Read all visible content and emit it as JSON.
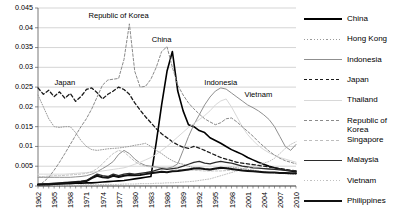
{
  "chart_data": {
    "type": "line",
    "title": "",
    "xlabel": "",
    "ylabel": "",
    "xlim": [
      1962,
      2010
    ],
    "ylim": [
      0,
      0.045
    ],
    "grid": true,
    "legend_position": "right",
    "ytick_labels": [
      "0",
      "0.005",
      "0.01",
      "0.015",
      "0.02",
      "0.025",
      "0.03",
      "0.035",
      "0.04",
      "0.045"
    ],
    "ytick_values": [
      0,
      0.005,
      0.01,
      0.015,
      0.02,
      0.025,
      0.03,
      0.035,
      0.04,
      0.045
    ],
    "xtick_labels": [
      "1962",
      "1965",
      "1968",
      "1971",
      "1974",
      "1977",
      "1980",
      "1983",
      "1986",
      "1989",
      "1992",
      "1995",
      "1998",
      "2001",
      "2004",
      "2007",
      "2010"
    ],
    "xtick_values": [
      1962,
      1965,
      1968,
      1971,
      1974,
      1977,
      1980,
      1983,
      1986,
      1989,
      1992,
      1995,
      1998,
      2001,
      2004,
      2007,
      2010
    ],
    "x": [
      1962,
      1963,
      1964,
      1965,
      1966,
      1967,
      1968,
      1969,
      1970,
      1971,
      1972,
      1973,
      1974,
      1975,
      1976,
      1977,
      1978,
      1979,
      1980,
      1981,
      1982,
      1983,
      1984,
      1985,
      1986,
      1987,
      1988,
      1989,
      1990,
      1991,
      1992,
      1993,
      1994,
      1995,
      1996,
      1997,
      1998,
      1999,
      2000,
      2001,
      2002,
      2003,
      2004,
      2005,
      2006,
      2007,
      2008,
      2009,
      2010
    ],
    "annotations": [
      {
        "text": "Japan",
        "x": 1967,
        "y": 0.0255
      },
      {
        "text": "Republic of Korea",
        "x": 1977,
        "y": 0.0425
      },
      {
        "text": "China",
        "x": 1985,
        "y": 0.0365
      },
      {
        "text": "Indonesia",
        "x": 1996,
        "y": 0.0255
      },
      {
        "text": "Vietnam",
        "x": 2003,
        "y": 0.0225
      }
    ],
    "series": [
      {
        "name": "China",
        "color": "#000000",
        "style": "solid",
        "width": 1.6,
        "values": [
          0.0004,
          0.0004,
          0.0005,
          0.0005,
          0.0006,
          0.0006,
          0.0006,
          0.0007,
          0.0007,
          0.0008,
          0.0008,
          0.0009,
          0.001,
          0.0011,
          0.0012,
          0.0013,
          0.0014,
          0.0016,
          0.0018,
          0.002,
          0.0022,
          0.0024,
          0.011,
          0.0205,
          0.029,
          0.034,
          0.024,
          0.019,
          0.0155,
          0.015,
          0.014,
          0.0135,
          0.0122,
          0.0115,
          0.0108,
          0.01,
          0.0092,
          0.0086,
          0.008,
          0.0072,
          0.0066,
          0.006,
          0.0055,
          0.005,
          0.0046,
          0.0043,
          0.004,
          0.0038,
          0.0036
        ]
      },
      {
        "name": "Hong Kong",
        "color": "#9a9a9a",
        "style": "dotted",
        "width": 1.0,
        "values": [
          0.023,
          0.02,
          0.017,
          0.015,
          0.0148,
          0.015,
          0.015,
          0.0135,
          0.0115,
          0.01,
          0.0092,
          0.009,
          0.0092,
          0.0094,
          0.0095,
          0.0096,
          0.0098,
          0.01,
          0.0103,
          0.0105,
          0.0108,
          0.01,
          0.009,
          0.0082,
          0.0072,
          0.0064,
          0.0058,
          0.0055,
          0.005,
          0.0046,
          0.0044,
          0.0042,
          0.004,
          0.0042,
          0.0044,
          0.0046,
          0.0048,
          0.0046,
          0.0044,
          0.0042,
          0.004,
          0.0038,
          0.0036,
          0.0034,
          0.0033,
          0.0032,
          0.0031,
          0.003,
          0.0029
        ]
      },
      {
        "name": "Indonesia",
        "color": "#8f8f8f",
        "style": "solid",
        "width": 1.0,
        "values": [
          0.0022,
          0.0022,
          0.0022,
          0.0022,
          0.0022,
          0.0022,
          0.0022,
          0.0023,
          0.0024,
          0.0026,
          0.003,
          0.0036,
          0.0044,
          0.0052,
          0.0062,
          0.008,
          0.009,
          0.0082,
          0.0068,
          0.0058,
          0.0052,
          0.005,
          0.0048,
          0.0046,
          0.0045,
          0.0048,
          0.0056,
          0.009,
          0.0125,
          0.0155,
          0.018,
          0.0205,
          0.0225,
          0.024,
          0.0248,
          0.0245,
          0.0235,
          0.0225,
          0.0215,
          0.0205,
          0.0198,
          0.019,
          0.018,
          0.0168,
          0.015,
          0.0125,
          0.01,
          0.009,
          0.0105
        ]
      },
      {
        "name": "Japan",
        "color": "#1a1a1a",
        "style": "dashed",
        "width": 1.3,
        "values": [
          0.0248,
          0.0232,
          0.0242,
          0.0226,
          0.0238,
          0.0222,
          0.0234,
          0.0214,
          0.0226,
          0.0244,
          0.0248,
          0.0236,
          0.022,
          0.0232,
          0.024,
          0.025,
          0.0244,
          0.0232,
          0.021,
          0.0192,
          0.0175,
          0.016,
          0.0145,
          0.0132,
          0.0122,
          0.0112,
          0.0104,
          0.0098,
          0.0095,
          0.01,
          0.0096,
          0.009,
          0.0084,
          0.0078,
          0.0072,
          0.0068,
          0.0064,
          0.006,
          0.0058,
          0.0056,
          0.0054,
          0.0052,
          0.005,
          0.0048,
          0.0046,
          0.0044,
          0.0042,
          0.004,
          0.0038
        ]
      },
      {
        "name": "Thailand",
        "color": "#d8d8d8",
        "style": "solid",
        "width": 1.0,
        "values": [
          0.003,
          0.003,
          0.003,
          0.003,
          0.003,
          0.003,
          0.0031,
          0.0032,
          0.0033,
          0.0034,
          0.0035,
          0.0036,
          0.0038,
          0.004,
          0.0042,
          0.0044,
          0.0046,
          0.005,
          0.0055,
          0.006,
          0.0066,
          0.0072,
          0.008,
          0.009,
          0.01,
          0.0112,
          0.0124,
          0.0136,
          0.0148,
          0.0158,
          0.0168,
          0.0178,
          0.019,
          0.0205,
          0.0215,
          0.022,
          0.02,
          0.0175,
          0.015,
          0.013,
          0.0115,
          0.0102,
          0.0092,
          0.0084,
          0.0078,
          0.0072,
          0.0068,
          0.0064,
          0.006
        ]
      },
      {
        "name": "Republic of Korea",
        "color": "#8a8a8a",
        "style": "dashed",
        "width": 1.0,
        "values": [
          0.0,
          0.001,
          0.0022,
          0.004,
          0.006,
          0.0082,
          0.0105,
          0.0128,
          0.015,
          0.017,
          0.0195,
          0.0225,
          0.0255,
          0.0268,
          0.027,
          0.0272,
          0.032,
          0.041,
          0.029,
          0.025,
          0.0252,
          0.027,
          0.03,
          0.034,
          0.0352,
          0.03,
          0.0255,
          0.023,
          0.021,
          0.0195,
          0.0182,
          0.017,
          0.0162,
          0.0155,
          0.016,
          0.017,
          0.0172,
          0.0162,
          0.015,
          0.0138,
          0.0126,
          0.0112,
          0.01,
          0.0088,
          0.0078,
          0.007,
          0.0064,
          0.006,
          0.0056
        ]
      },
      {
        "name": "Singapore",
        "color": "#bdbdbd",
        "style": "dashed",
        "width": 0.9,
        "values": [
          0.0024,
          0.0024,
          0.0025,
          0.0026,
          0.0026,
          0.0027,
          0.0028,
          0.0029,
          0.003,
          0.0032,
          0.0036,
          0.0044,
          0.0056,
          0.007,
          0.0082,
          0.009,
          0.0086,
          0.0074,
          0.0062,
          0.0054,
          0.005,
          0.0048,
          0.0046,
          0.0045,
          0.0044,
          0.0043,
          0.0042,
          0.0041,
          0.004,
          0.004,
          0.0039,
          0.0038,
          0.0038,
          0.0038,
          0.0038,
          0.0039,
          0.004,
          0.004,
          0.004,
          0.0039,
          0.0038,
          0.0037,
          0.0036,
          0.0035,
          0.0034,
          0.0033,
          0.0032,
          0.0031,
          0.003
        ]
      },
      {
        "name": "Malaysia",
        "color": "#2b2b2b",
        "style": "solid",
        "width": 1.3,
        "values": [
          0.0004,
          0.0005,
          0.0006,
          0.0007,
          0.0008,
          0.0009,
          0.001,
          0.0011,
          0.0012,
          0.0014,
          0.0022,
          0.003,
          0.0026,
          0.0024,
          0.003,
          0.0026,
          0.003,
          0.0032,
          0.003,
          0.0032,
          0.0034,
          0.0036,
          0.004,
          0.0044,
          0.0042,
          0.0044,
          0.0046,
          0.005,
          0.0055,
          0.006,
          0.0062,
          0.0058,
          0.0056,
          0.006,
          0.0062,
          0.006,
          0.0058,
          0.0054,
          0.005,
          0.0048,
          0.0046,
          0.0045,
          0.0044,
          0.0043,
          0.0042,
          0.0041,
          0.004,
          0.0039,
          0.0038
        ]
      },
      {
        "name": "Vietnam",
        "color": "#c0c0c0",
        "style": "dotted",
        "width": 1.0,
        "values": [
          0.0002,
          0.0002,
          0.0002,
          0.0002,
          0.0002,
          0.0002,
          0.0002,
          0.0002,
          0.0003,
          0.0003,
          0.0003,
          0.0003,
          0.0004,
          0.0004,
          0.0004,
          0.0004,
          0.0005,
          0.0005,
          0.0005,
          0.0006,
          0.0006,
          0.0006,
          0.0007,
          0.0007,
          0.0008,
          0.0008,
          0.0009,
          0.001,
          0.0011,
          0.0012,
          0.0014,
          0.0016,
          0.0018,
          0.0022,
          0.0026,
          0.003,
          0.0034,
          0.0038,
          0.0042,
          0.0046,
          0.005,
          0.0054,
          0.0058,
          0.0062,
          0.007,
          0.0082,
          0.0095,
          0.0105,
          0.0112
        ]
      },
      {
        "name": "Philippines",
        "color": "#111111",
        "style": "solid",
        "width": 2.0,
        "values": [
          0.0003,
          0.0004,
          0.0004,
          0.0005,
          0.0006,
          0.0007,
          0.0008,
          0.0009,
          0.001,
          0.0012,
          0.002,
          0.0026,
          0.0022,
          0.0021,
          0.0026,
          0.0023,
          0.0026,
          0.0028,
          0.0027,
          0.0028,
          0.003,
          0.0032,
          0.0034,
          0.0036,
          0.0035,
          0.0037,
          0.0038,
          0.004,
          0.0042,
          0.0044,
          0.0045,
          0.0043,
          0.0042,
          0.0044,
          0.0046,
          0.0045,
          0.0043,
          0.0041,
          0.0039,
          0.0038,
          0.0037,
          0.0036,
          0.0035,
          0.0034,
          0.0034,
          0.0033,
          0.0033,
          0.0032,
          0.0032
        ]
      }
    ]
  },
  "legend": {
    "items": [
      {
        "label": "China",
        "color": "#000000",
        "style": "solid",
        "width": 1.6
      },
      {
        "label": "Hong Kong",
        "color": "#9a9a9a",
        "style": "dotted",
        "width": 1.0
      },
      {
        "label": "Indonesia",
        "color": "#8f8f8f",
        "style": "solid",
        "width": 1.0
      },
      {
        "label": "Japan",
        "color": "#1a1a1a",
        "style": "dashed",
        "width": 1.3
      },
      {
        "label": "Thailand",
        "color": "#d8d8d8",
        "style": "solid",
        "width": 1.0
      },
      {
        "label": "Republic of\nKorea",
        "color": "#8a8a8a",
        "style": "dashed",
        "width": 1.0
      },
      {
        "label": "Singapore",
        "color": "#bdbdbd",
        "style": "dashed",
        "width": 0.9
      },
      {
        "label": "Malaysia",
        "color": "#2b2b2b",
        "style": "solid",
        "width": 1.3
      },
      {
        "label": "Vietnam",
        "color": "#c0c0c0",
        "style": "dotted",
        "width": 1.0
      },
      {
        "label": "Philippines",
        "color": "#111111",
        "style": "solid",
        "width": 2.0
      }
    ]
  }
}
